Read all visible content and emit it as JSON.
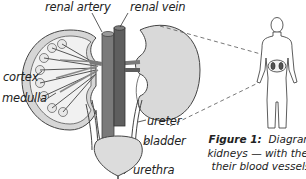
{
  "diagram": {
    "labels": {
      "renal_artery": "renal artery",
      "renal_vein": "renal vein",
      "cortex": "cortex",
      "medulla": "medulla",
      "ureter": "ureter",
      "bladder": "bladder",
      "urethra": "urethra"
    },
    "caption": {
      "figure_label": "Figure 1:",
      "line1": "Diagram to",
      "line2": "kidneys — with the gro",
      "line3": "their blood vessels ar"
    },
    "colors": {
      "artery": "#7a7a7a",
      "vein": "#5e5e5e",
      "kidney_fill": "#d9d9d9",
      "cortex_fill": "#e9e9e9",
      "outline": "#444444"
    }
  }
}
